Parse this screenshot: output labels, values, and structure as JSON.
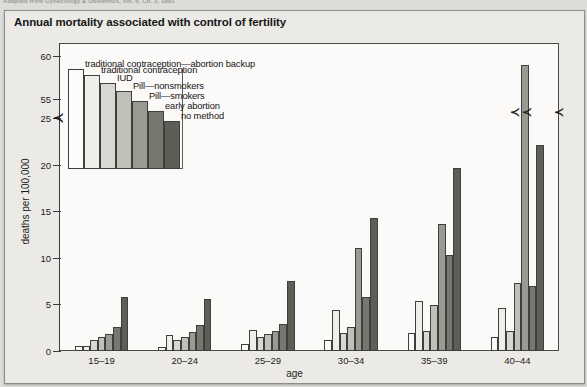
{
  "source_line": "Adapted from Gynecology & Obstetrics, Vol. 6, Ch. 3, 1991",
  "figure": {
    "title": "Annual mortality associated with control of fertility"
  },
  "chart_data": {
    "type": "bar",
    "title": "Annual mortality associated with control of fertility",
    "xlabel": "age",
    "ylabel": "deaths per 100,000",
    "categories": [
      "15–19",
      "20–24",
      "25–29",
      "30–34",
      "35–39",
      "40–44"
    ],
    "ylim": [
      0,
      60
    ],
    "y_ticks": [
      "0",
      "5",
      "10",
      "15",
      "20",
      "25",
      "55",
      "60"
    ],
    "y_axis_break": {
      "between": [
        25,
        55
      ],
      "marker": "zigzag"
    },
    "grid": false,
    "legend_position": "upper-left-inside",
    "series": [
      {
        "name": "traditional contraception—abortion backup",
        "color": "#fbfbf9",
        "values": [
          0.5,
          0.4,
          0.8,
          1.2,
          1.9,
          1.5
        ]
      },
      {
        "name": "traditional contraception",
        "color": "#eeeeea",
        "values": [
          0.5,
          1.7,
          2.3,
          4.4,
          5.4,
          4.6
        ]
      },
      {
        "name": "IUD",
        "color": "#d8d8d2",
        "values": [
          1.2,
          1.2,
          1.5,
          1.9,
          2.1,
          2.1
        ]
      },
      {
        "name": "Pill—nonsmokers",
        "color": "#c0c0b9",
        "values": [
          1.5,
          1.5,
          1.8,
          2.6,
          4.9,
          7.3
        ]
      },
      {
        "name": "Pill—smokers",
        "color": "#9a9a93",
        "values": [
          1.8,
          2.0,
          2.1,
          11.1,
          13.6,
          59.0
        ]
      },
      {
        "name": "early abortion",
        "color": "#77776f",
        "values": [
          2.6,
          2.8,
          2.9,
          5.8,
          10.3,
          7.0
        ]
      },
      {
        "name": "no method",
        "color": "#5e5e57",
        "values": [
          5.8,
          5.6,
          7.5,
          14.3,
          19.6,
          22.1
        ]
      }
    ]
  }
}
